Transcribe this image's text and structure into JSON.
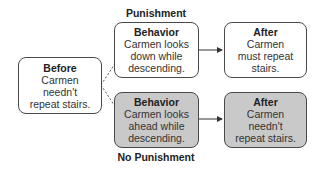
{
  "diagram": {
    "labels": {
      "top": "Punishment",
      "bottom": "No Punishment"
    },
    "before": {
      "title": "Before",
      "lines": [
        "Carmen",
        "needn't",
        "repeat stairs."
      ]
    },
    "punishment_path": {
      "behavior": {
        "title": "Behavior",
        "lines": [
          "Carmen looks",
          "down while",
          "descending."
        ]
      },
      "after": {
        "title": "After",
        "lines": [
          "Carmen",
          "must repeat",
          "stairs."
        ]
      }
    },
    "no_punishment_path": {
      "behavior": {
        "title": "Behavior",
        "lines": [
          "Carmen looks",
          "ahead while",
          "descending."
        ]
      },
      "after": {
        "title": "After",
        "lines": [
          "Carmen",
          "needn't",
          "repeat stairs."
        ]
      }
    },
    "colors": {
      "border": "#4a4a4a",
      "shaded_fill": "#c9c9c9",
      "plain_fill": "#ffffff"
    }
  }
}
